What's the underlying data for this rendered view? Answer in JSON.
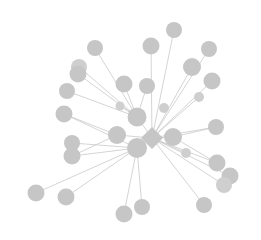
{
  "figure": {
    "kind": "node-link-network-graph",
    "width": 261,
    "height": 240,
    "background_color": "#ffffff"
  },
  "style": {
    "node_fill": "#c6c6c6",
    "node_fill_light": "#cfcfcf",
    "edge_color": "#c9c9c9",
    "edge_width": 0.8,
    "node_radius_default": 7.5,
    "hub_size": 21
  },
  "chart_data": {
    "type": "scatter",
    "title": "",
    "xlabel": "",
    "ylabel": "",
    "layout": "force-directed star / hub-and-spoke",
    "grid": false,
    "legend": null,
    "xlim": [
      0,
      261
    ],
    "ylim": [
      0,
      240
    ],
    "node_count": 32,
    "edge_count": 34,
    "nodes": [
      {
        "id": "hub",
        "x": 152,
        "y": 138,
        "r": 11,
        "shape": "diamond",
        "fill": "#c6c6c6",
        "label": ""
      },
      {
        "id": "h2",
        "x": 137,
        "y": 148,
        "r": 10,
        "shape": "circle",
        "fill": "#c6c6c6",
        "label": ""
      },
      {
        "id": "h3",
        "x": 137,
        "y": 117,
        "r": 9.5,
        "shape": "circle",
        "fill": "#c6c6c6",
        "label": ""
      },
      {
        "id": "h4",
        "x": 117,
        "y": 135,
        "r": 9,
        "shape": "circle",
        "fill": "#c6c6c6",
        "label": ""
      },
      {
        "id": "h5",
        "x": 173,
        "y": 137,
        "r": 9,
        "shape": "circle",
        "fill": "#c6c6c6",
        "label": ""
      },
      {
        "id": "n01",
        "x": 95,
        "y": 48,
        "r": 8,
        "shape": "circle",
        "fill": "#c6c6c6",
        "label": ""
      },
      {
        "id": "n02",
        "x": 79,
        "y": 67,
        "r": 8,
        "shape": "circle",
        "fill": "#cfcfcf",
        "label": ""
      },
      {
        "id": "n03",
        "x": 78,
        "y": 74,
        "r": 8.5,
        "shape": "circle",
        "fill": "#c6c6c6",
        "label": ""
      },
      {
        "id": "n04",
        "x": 67,
        "y": 91,
        "r": 8,
        "shape": "circle",
        "fill": "#c6c6c6",
        "label": ""
      },
      {
        "id": "n05",
        "x": 64,
        "y": 114,
        "r": 8.5,
        "shape": "circle",
        "fill": "#c6c6c6",
        "label": ""
      },
      {
        "id": "n06",
        "x": 124,
        "y": 84,
        "r": 8.5,
        "shape": "circle",
        "fill": "#c6c6c6",
        "label": ""
      },
      {
        "id": "n07",
        "x": 147,
        "y": 86,
        "r": 8,
        "shape": "circle",
        "fill": "#c6c6c6",
        "label": ""
      },
      {
        "id": "n08",
        "x": 151,
        "y": 46,
        "r": 8.5,
        "shape": "circle",
        "fill": "#c6c6c6",
        "label": ""
      },
      {
        "id": "n09",
        "x": 174,
        "y": 30,
        "r": 8,
        "shape": "circle",
        "fill": "#c6c6c6",
        "label": ""
      },
      {
        "id": "n10",
        "x": 209,
        "y": 49,
        "r": 8,
        "shape": "circle",
        "fill": "#c6c6c6",
        "label": ""
      },
      {
        "id": "n11",
        "x": 192,
        "y": 67,
        "r": 9,
        "shape": "circle",
        "fill": "#c6c6c6",
        "label": ""
      },
      {
        "id": "n12",
        "x": 212,
        "y": 81,
        "r": 8.5,
        "shape": "circle",
        "fill": "#c6c6c6",
        "label": ""
      },
      {
        "id": "n13",
        "x": 216,
        "y": 127,
        "r": 8,
        "shape": "circle",
        "fill": "#c6c6c6",
        "label": ""
      },
      {
        "id": "n14",
        "x": 217,
        "y": 163,
        "r": 8.5,
        "shape": "circle",
        "fill": "#c6c6c6",
        "label": ""
      },
      {
        "id": "n15",
        "x": 230,
        "y": 176,
        "r": 8.5,
        "shape": "circle",
        "fill": "#c6c6c6",
        "label": ""
      },
      {
        "id": "n16",
        "x": 224,
        "y": 185,
        "r": 8,
        "shape": "circle",
        "fill": "#cfcfcf",
        "label": ""
      },
      {
        "id": "n17",
        "x": 204,
        "y": 205,
        "r": 8,
        "shape": "circle",
        "fill": "#c6c6c6",
        "label": ""
      },
      {
        "id": "n18",
        "x": 142,
        "y": 207,
        "r": 8,
        "shape": "circle",
        "fill": "#c6c6c6",
        "label": ""
      },
      {
        "id": "n19",
        "x": 124,
        "y": 214,
        "r": 8.5,
        "shape": "circle",
        "fill": "#c6c6c6",
        "label": ""
      },
      {
        "id": "n20",
        "x": 66,
        "y": 197,
        "r": 8.5,
        "shape": "circle",
        "fill": "#c6c6c6",
        "label": ""
      },
      {
        "id": "n21",
        "x": 36,
        "y": 193,
        "r": 8.5,
        "shape": "circle",
        "fill": "#c6c6c6",
        "label": ""
      },
      {
        "id": "n22",
        "x": 72,
        "y": 143,
        "r": 8,
        "shape": "circle",
        "fill": "#c6c6c6",
        "label": ""
      },
      {
        "id": "n23",
        "x": 72,
        "y": 156,
        "r": 8.5,
        "shape": "circle",
        "fill": "#c6c6c6",
        "label": ""
      },
      {
        "id": "n24",
        "x": 199,
        "y": 97,
        "r": 5,
        "shape": "circle",
        "fill": "#cfcfcf",
        "label": ""
      },
      {
        "id": "n25",
        "x": 164,
        "y": 108,
        "r": 5,
        "shape": "circle",
        "fill": "#cfcfcf",
        "label": ""
      },
      {
        "id": "n26",
        "x": 120,
        "y": 106,
        "r": 4.5,
        "shape": "circle",
        "fill": "#cfcfcf",
        "label": ""
      },
      {
        "id": "n27",
        "x": 186,
        "y": 153,
        "r": 5,
        "shape": "circle",
        "fill": "#cfcfcf",
        "label": ""
      }
    ],
    "edges": [
      {
        "source": "hub",
        "target": "h2"
      },
      {
        "source": "hub",
        "target": "h3"
      },
      {
        "source": "hub",
        "target": "h5"
      },
      {
        "source": "hub",
        "target": "h4"
      },
      {
        "source": "hub",
        "target": "n09"
      },
      {
        "source": "hub",
        "target": "n08"
      },
      {
        "source": "hub",
        "target": "n10"
      },
      {
        "source": "hub",
        "target": "n11"
      },
      {
        "source": "hub",
        "target": "n12"
      },
      {
        "source": "hub",
        "target": "n13"
      },
      {
        "source": "hub",
        "target": "n14"
      },
      {
        "source": "hub",
        "target": "n15"
      },
      {
        "source": "hub",
        "target": "n16"
      },
      {
        "source": "hub",
        "target": "n17"
      },
      {
        "source": "hub",
        "target": "n24"
      },
      {
        "source": "hub",
        "target": "n27"
      },
      {
        "source": "h3",
        "target": "n01"
      },
      {
        "source": "h3",
        "target": "n02"
      },
      {
        "source": "h3",
        "target": "n03"
      },
      {
        "source": "h3",
        "target": "n04"
      },
      {
        "source": "h3",
        "target": "n06"
      },
      {
        "source": "h3",
        "target": "n07"
      },
      {
        "source": "h3",
        "target": "n26"
      },
      {
        "source": "h2",
        "target": "n05"
      },
      {
        "source": "h2",
        "target": "n22"
      },
      {
        "source": "h2",
        "target": "n23"
      },
      {
        "source": "h2",
        "target": "n20"
      },
      {
        "source": "h2",
        "target": "n21"
      },
      {
        "source": "h2",
        "target": "n19"
      },
      {
        "source": "h2",
        "target": "n18"
      },
      {
        "source": "h4",
        "target": "n05"
      },
      {
        "source": "h4",
        "target": "n23"
      },
      {
        "source": "h5",
        "target": "n13"
      },
      {
        "source": "h5",
        "target": "n14"
      }
    ]
  }
}
